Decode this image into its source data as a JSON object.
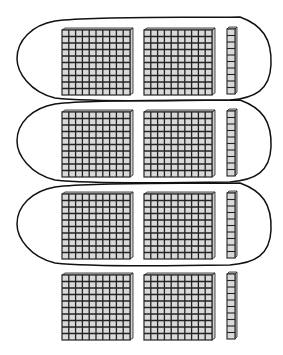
{
  "diagram": {
    "colors": {
      "background": "#ffffff",
      "cell_fill": "#d9d9d9",
      "grid_line": "#222222",
      "loop_stroke": "#111111"
    },
    "rows": [
      {
        "flats": 2,
        "rods": 1,
        "circled": true
      },
      {
        "flats": 2,
        "rods": 1,
        "circled": true
      },
      {
        "flats": 2,
        "rods": 1,
        "circled": true
      },
      {
        "flats": 2,
        "rods": 1,
        "circled": false
      }
    ],
    "flat_grid": 10,
    "rod_units": 10,
    "layout": {
      "row_tops": [
        28,
        110,
        192,
        273
      ],
      "flat1_x": 62,
      "flat2_x": 144,
      "rod_x": 227,
      "flat_w": 68,
      "flat_h": 67,
      "rod_w": 8,
      "rod_h": 67
    },
    "loops": [
      {
        "top": 17,
        "bottom": 100
      },
      {
        "top": 100,
        "bottom": 182
      },
      {
        "top": 183,
        "bottom": 265
      }
    ]
  }
}
